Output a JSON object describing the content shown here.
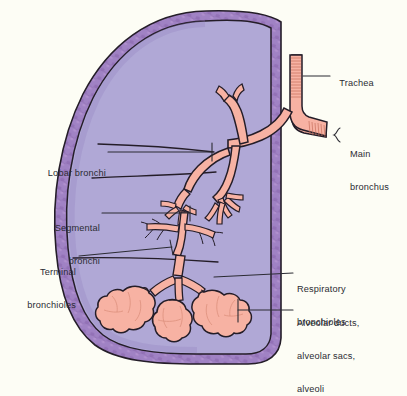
{
  "figure": {
    "type": "anatomical-illustration",
    "background_color": "#fdfdf5",
    "colors": {
      "lung_parenchyma": "#b0a8d6",
      "pleura_border": "#9a79b8",
      "pleura_border_dark": "#8a66a8",
      "airway_fill": "#f7b2a3",
      "airway_fill_light": "#fbc6b8",
      "outline": "#241d28",
      "leader_line": "#2b2b33",
      "text": "#2b2b33"
    }
  },
  "labels": [
    {
      "id": "trachea",
      "text": "Trachea",
      "lines": [
        "Trachea"
      ],
      "side": "right",
      "x": 334,
      "y": 72
    },
    {
      "id": "main-bronchus",
      "text": "Main bronchus",
      "lines": [
        "Main",
        "bronchus"
      ],
      "side": "right",
      "x": 350,
      "y": 133
    },
    {
      "id": "lobar-bronchi",
      "text": "Lobar bronchi",
      "lines": [
        "Lobar bronchi"
      ],
      "side": "left",
      "x": 37,
      "y": 147
    },
    {
      "id": "segmental-bronchi",
      "text": "Segmental bronchi",
      "lines": [
        "Segmental",
        "bronchi"
      ],
      "side": "left",
      "x": 38,
      "y": 205
    },
    {
      "id": "terminal-bronchioles",
      "text": "Terminal bronchioles",
      "lines": [
        "Terminal",
        "bronchioles"
      ],
      "side": "left",
      "x": 22,
      "y": 250
    },
    {
      "id": "respiratory-bronchioles",
      "text": "Respiratory bronchioles",
      "lines": [
        "Respiratory",
        "bronchioles"
      ],
      "side": "right",
      "x": 297,
      "y": 257
    },
    {
      "id": "alveolar-structures",
      "text": "Alveolar ducts, alveolar sacs, alveoli",
      "lines": [
        "Alveolar ducts,",
        "alveolar sacs,",
        "alveoli"
      ],
      "side": "right",
      "x": 297,
      "y": 292
    }
  ]
}
